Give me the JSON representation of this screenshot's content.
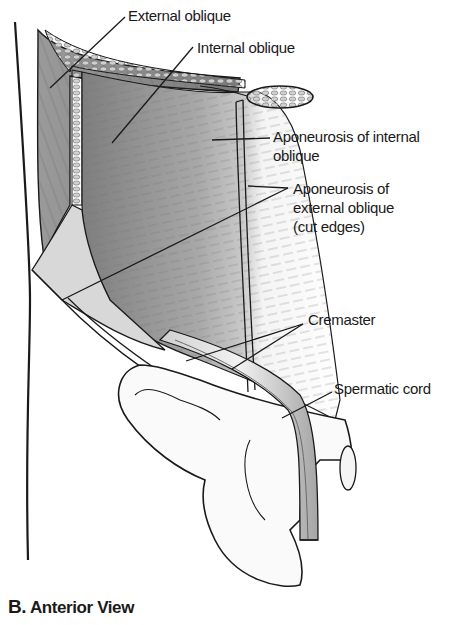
{
  "figure": {
    "caption_letter": "B.",
    "caption_text": "Anterior View",
    "labels": {
      "external_oblique": "External oblique",
      "internal_oblique": "Internal oblique",
      "aponeurosis_internal_line1": "Aponeurosis of internal",
      "aponeurosis_internal_line2": "oblique",
      "aponeurosis_external_line1": "Aponeurosis of",
      "aponeurosis_external_line2": "external oblique",
      "aponeurosis_external_line3": "(cut edges)",
      "cremaster": "Cremaster",
      "spermatic_cord": "Spermatic cord"
    },
    "colors": {
      "ink": "#1a1a1a",
      "muscle_dark": "#8a8a8a",
      "muscle_mid": "#b5b5b5",
      "muscle_light": "#e6e6e6",
      "background": "#ffffff"
    }
  }
}
